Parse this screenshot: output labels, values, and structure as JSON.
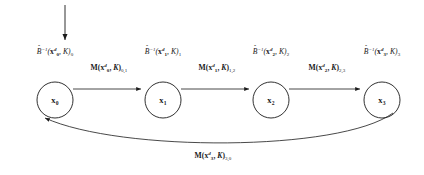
{
  "figure": {
    "type": "directed-graph-diagram",
    "background_color": "#ffffff",
    "stroke_color": "#1a1a1a",
    "text_color": "#1a1a1a"
  },
  "input_arrow": {
    "name": "input-arrow",
    "from": [
      65,
      5
    ],
    "to": [
      65,
      41
    ]
  },
  "nodes": [
    {
      "id": "x0",
      "label_main": "x",
      "label_sub": "0",
      "cx": 55,
      "cy": 100,
      "r": 18,
      "state_label": {
        "fn": "B",
        "hat": "ˆ",
        "exp": "−1",
        "arg_main": "x",
        "arg_sup": "d",
        "arg_sub": "0",
        "kernel": "K",
        "index": "0",
        "x": 55,
        "y": 52
      }
    },
    {
      "id": "x1",
      "label_main": "x",
      "label_sub": "1",
      "cx": 163,
      "cy": 100,
      "r": 18,
      "state_label": {
        "fn": "B",
        "hat": "ˆ",
        "exp": "−1",
        "arg_main": "x",
        "arg_sup": "d",
        "arg_sub": "1",
        "kernel": "K",
        "index": "1",
        "x": 163,
        "y": 52
      }
    },
    {
      "id": "x2",
      "label_main": "x",
      "label_sub": "2",
      "cx": 271,
      "cy": 100,
      "r": 18,
      "state_label": {
        "fn": "B",
        "hat": "ˆ",
        "exp": "−1",
        "arg_main": "x",
        "arg_sup": "d",
        "arg_sub": "2",
        "kernel": "K",
        "index": "2",
        "x": 271,
        "y": 52
      }
    },
    {
      "id": "x3",
      "label_main": "x",
      "label_sub": "3",
      "cx": 382,
      "cy": 100,
      "r": 18,
      "state_label": {
        "fn": "B",
        "hat": "ˆ",
        "exp": "−1",
        "arg_main": "x",
        "arg_sup": "d",
        "arg_sub": "3",
        "kernel": "K",
        "index": "3",
        "x": 382,
        "y": 52
      }
    }
  ],
  "edges": [
    {
      "id": "e01",
      "from": "x0",
      "to": "x1",
      "kind": "straight",
      "label": {
        "fn": "M",
        "arg_main": "x",
        "arg_sup": "d",
        "arg_sub": "0",
        "kernel": "K",
        "index": "0,1",
        "x": 109,
        "y": 68
      }
    },
    {
      "id": "e12",
      "from": "x1",
      "to": "x2",
      "kind": "straight",
      "label": {
        "fn": "M",
        "arg_main": "x",
        "arg_sup": "d",
        "arg_sub": "1",
        "kernel": "K",
        "index": "1,2",
        "x": 217,
        "y": 68
      }
    },
    {
      "id": "e23",
      "from": "x2",
      "to": "x3",
      "kind": "straight",
      "label": {
        "fn": "M",
        "arg_main": "x",
        "arg_sup": "d",
        "arg_sub": "2",
        "kernel": "K",
        "index": "2,3",
        "x": 327,
        "y": 68
      }
    },
    {
      "id": "e30",
      "from": "x3",
      "to": "x0",
      "kind": "curved-feedback",
      "label": {
        "fn": "M",
        "arg_main": "x",
        "arg_sup": "d",
        "arg_sub": "3",
        "kernel": "K",
        "index": "3,0",
        "x": 213,
        "y": 156
      }
    }
  ]
}
